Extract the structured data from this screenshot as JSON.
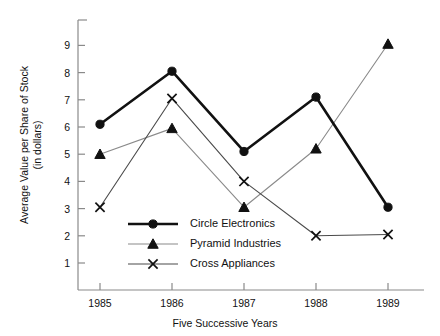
{
  "chart_data": {
    "type": "line",
    "title": "",
    "subtitle": "",
    "xlabel": "Five Successive Years",
    "ylabel": "Average Value per Share of Stock (in dollars)",
    "ylabel_lines": [
      "Average Value per Share of Stock",
      "(in dollars)"
    ],
    "categories": [
      "1985",
      "1986",
      "1987",
      "1988",
      "1989"
    ],
    "x": [
      1985,
      1986,
      1987,
      1988,
      1989
    ],
    "ylim": [
      0,
      9.6
    ],
    "xlim": [
      1984.6,
      1989.55
    ],
    "yticks": [
      1,
      2,
      3,
      4,
      5,
      6,
      7,
      8,
      9
    ],
    "ytick_labels": [
      "1",
      "2",
      "3",
      "4",
      "5",
      "6",
      "7",
      "8",
      "9"
    ],
    "grid": false,
    "legend_position": "center-left-inside",
    "series": [
      {
        "name": "Circle Electronics",
        "marker": "circle",
        "color": "#111111",
        "line_width": 2.6,
        "values": [
          6.1,
          8.05,
          5.1,
          7.1,
          3.05
        ]
      },
      {
        "name": "Pyramid Industries",
        "marker": "triangle",
        "color": "#8a8a8a",
        "line_width": 1.1,
        "values": [
          5.0,
          5.95,
          3.05,
          5.2,
          9.05
        ]
      },
      {
        "name": "Cross Appliances",
        "marker": "cross",
        "color": "#4a4a4a",
        "line_width": 1.1,
        "values": [
          3.05,
          7.05,
          4.0,
          2.0,
          2.05
        ]
      }
    ]
  },
  "axes": {
    "axis_color": "#8a8a8a",
    "text_color": "#111111",
    "background": "#ffffff"
  },
  "legend": {
    "entries": [
      {
        "label": "Circle Electronics",
        "marker": "circle-marker-icon"
      },
      {
        "label": "Pyramid Industries",
        "marker": "triangle-marker-icon"
      },
      {
        "label": "Cross Appliances",
        "marker": "cross-marker-icon"
      }
    ]
  }
}
